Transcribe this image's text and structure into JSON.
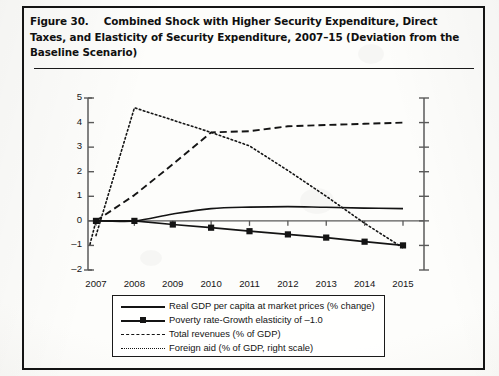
{
  "figure": {
    "number": "Figure 30.",
    "title": "Combined Shock with Higher Security Expenditure, Direct Taxes, and Elasticity of Security Expenditure, 2007–15 (Deviation from the Baseline Scenario)"
  },
  "chart_data": {
    "type": "line",
    "title": "Combined Shock with Higher Security Expenditure, Direct Taxes, and Elasticity of Security Expenditure, 2007–15 (Deviation from the Baseline Scenario)",
    "xlabel": "",
    "ylabel": "",
    "x": [
      2007,
      2008,
      2009,
      2010,
      2011,
      2012,
      2013,
      2014,
      2015
    ],
    "categories": [
      "2007",
      "2008",
      "2009",
      "2010",
      "2011",
      "2012",
      "2013",
      "2014",
      "2015"
    ],
    "ylim": [
      -2,
      5
    ],
    "yticks": [
      -2,
      -1,
      0,
      1,
      2,
      3,
      4,
      5
    ],
    "ytick_labels": [
      "–2",
      "–1",
      "0",
      "1",
      "2",
      "3",
      "4",
      "5"
    ],
    "right_axis": {
      "visible": true,
      "labeled": false,
      "tick_count": 8,
      "note": "right scale, ticks unlabeled"
    },
    "grid": false,
    "legend_position": "below-center",
    "series": [
      {
        "name": "Real GDP per capita at market prices (% change)",
        "style": "solid",
        "marker": "none",
        "axis": "left",
        "values": [
          0.0,
          0.0,
          0.28,
          0.5,
          0.56,
          0.58,
          0.55,
          0.52,
          0.5
        ]
      },
      {
        "name": "Poverty rate-Growth elasticity of –1.0",
        "style": "solid",
        "marker": "square",
        "axis": "left",
        "values": [
          0.0,
          0.0,
          -0.15,
          -0.28,
          -0.42,
          -0.55,
          -0.68,
          -0.85,
          -1.0
        ]
      },
      {
        "name": "Total revenues (% of GDP)",
        "style": "dashed",
        "marker": "none",
        "axis": "left",
        "values": [
          0.0,
          1.05,
          2.3,
          3.6,
          3.65,
          3.85,
          3.9,
          3.95,
          4.0
        ]
      },
      {
        "name": "Foreign aid (% of GDP, right scale)",
        "style": "dotted",
        "marker": "none",
        "axis": "right",
        "values": [
          -0.6,
          4.6,
          4.1,
          3.6,
          3.05,
          2.05,
          1.0,
          -0.1,
          -1.1
        ]
      }
    ]
  },
  "legend": {
    "items": [
      {
        "label": "Real GDP per capita at market prices (% change)",
        "style": "solid"
      },
      {
        "label": "Poverty rate-Growth elasticity of –1.0",
        "style": "marker"
      },
      {
        "label": "Total revenues (% of GDP)",
        "style": "dashed"
      },
      {
        "label": "Foreign aid (% of GDP, right scale)",
        "style": "dotted"
      }
    ]
  },
  "colors": {
    "ink": "#141414",
    "paper": "#fdfdfb",
    "axis": "#5a5a5a"
  }
}
